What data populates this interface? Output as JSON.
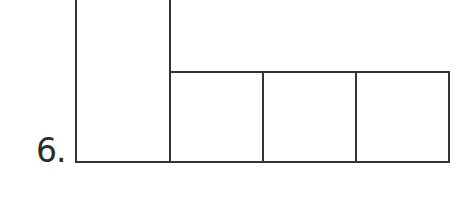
{
  "problem": {
    "number_label": "6."
  },
  "figure": {
    "stroke_color": "#333333",
    "tall_rect": {
      "x": 76,
      "y": -2,
      "width": 94,
      "height": 164
    },
    "squares": [
      {
        "x": 170,
        "y": 72,
        "width": 93,
        "height": 90
      },
      {
        "x": 263,
        "y": 72,
        "width": 93,
        "height": 90
      },
      {
        "x": 356,
        "y": 72,
        "width": 93,
        "height": 90
      }
    ]
  }
}
